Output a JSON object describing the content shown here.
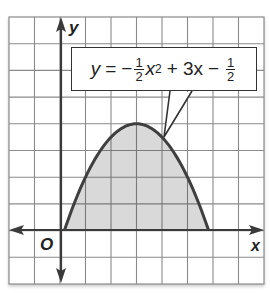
{
  "figure": {
    "x_axis_label": "x",
    "y_axis_label": "y",
    "origin_label": "O",
    "equation": {
      "lhs": "y",
      "equals": "=",
      "minus1": "−",
      "coef_num": "1",
      "coef_den": "2",
      "x_var": "x",
      "exp": "2",
      "plus": "+",
      "term2": "3x",
      "minus2": "−",
      "const_num": "1",
      "const_den": "2"
    }
  },
  "colors": {
    "curve": "#3f3f3f",
    "fill": "#d9d9d9",
    "grid": "#8a8a8a",
    "axis": "#3a3a3a"
  },
  "chart_data": {
    "type": "line",
    "xlabel": "x",
    "ylabel": "y",
    "xlim": [
      -2,
      8
    ],
    "ylim": [
      -2,
      8
    ],
    "grid": true,
    "series": [
      {
        "name": "y = -1/2 x^2 + 3x - 1/2",
        "x": [
          0.17,
          0.5,
          1,
          1.5,
          2,
          2.5,
          3,
          3.5,
          4,
          4.5,
          5,
          5.5,
          5.83
        ],
        "y": [
          0,
          0.875,
          2,
          2.875,
          3.5,
          3.875,
          4,
          3.875,
          3.5,
          2.875,
          2,
          0.875,
          0
        ],
        "shaded_to_x_axis": true
      }
    ],
    "annotations": [
      "vertex (3, 4)",
      "roots x = 3 ± 2√2"
    ]
  }
}
